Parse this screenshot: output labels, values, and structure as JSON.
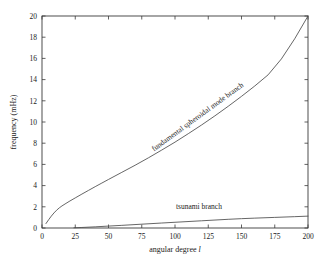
{
  "chart_data": {
    "type": "line",
    "title": "",
    "subtitle": "",
    "xlabel": "angular degree",
    "xlabel_symbol": "l",
    "ylabel": "frequency (mHz)",
    "xlim": [
      0,
      200
    ],
    "ylim": [
      0,
      20
    ],
    "xticks": [
      0,
      25,
      50,
      75,
      100,
      125,
      150,
      175,
      200
    ],
    "yticks": [
      0,
      2,
      4,
      6,
      8,
      10,
      12,
      14,
      16,
      18,
      20
    ],
    "xtick_labels": [
      "0",
      "25",
      "50",
      "75",
      "100",
      "125",
      "150",
      "175",
      "200"
    ],
    "ytick_labels": [
      "0",
      "2",
      "4",
      "6",
      "8",
      "10",
      "12",
      "14",
      "16",
      "18",
      "20"
    ],
    "grid": false,
    "legend_position": "inline-annotations",
    "line_color": "#4a4a4a",
    "frame_color": "#3a3a3a",
    "background_color": "#ffffff",
    "annotations": [
      {
        "name": "fundamental-branch-label",
        "text": "fundamental spheroidal mode branch",
        "x": 118,
        "y": 10.3,
        "rotation": -36
      },
      {
        "name": "tsunami-branch-label",
        "text": "tsunami branch",
        "x": 118,
        "y": 1.75,
        "rotation": 0
      }
    ],
    "series": [
      {
        "name": "fundamental spheroidal mode branch",
        "x": [
          3,
          5,
          7,
          9,
          11,
          13,
          15,
          18,
          21,
          25,
          30,
          35,
          40,
          45,
          50,
          60,
          70,
          80,
          90,
          100,
          110,
          120,
          130,
          140,
          150,
          160,
          170,
          180,
          190,
          200
        ],
        "values": [
          0.42,
          0.78,
          1.12,
          1.42,
          1.68,
          1.9,
          2.08,
          2.32,
          2.55,
          2.84,
          3.2,
          3.55,
          3.9,
          4.24,
          4.58,
          5.25,
          5.92,
          6.62,
          7.35,
          8.1,
          8.9,
          9.72,
          10.58,
          11.48,
          12.42,
          13.4,
          14.45,
          15.95,
          17.85,
          20.0
        ]
      },
      {
        "name": "tsunami branch",
        "x": [
          24,
          30,
          40,
          50,
          60,
          75,
          90,
          100,
          120,
          140,
          150,
          160,
          175,
          190,
          200
        ],
        "values": [
          0.02,
          0.05,
          0.11,
          0.18,
          0.25,
          0.36,
          0.47,
          0.54,
          0.68,
          0.82,
          0.88,
          0.93,
          1.0,
          1.07,
          1.12
        ]
      }
    ]
  },
  "figure": {
    "plot_box": {
      "left": 42,
      "top": 16,
      "right": 308,
      "bottom": 228
    }
  }
}
